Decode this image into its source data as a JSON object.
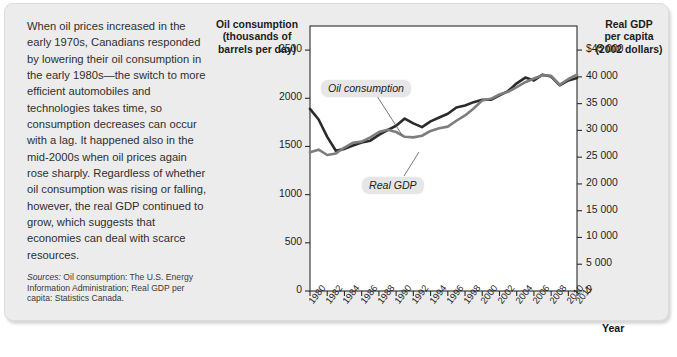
{
  "figure": {
    "background_color": "#ececec",
    "caption": "When oil prices increased in the early 1970s, Canadians responded by lowering their oil consumption in the early 1980s—the switch to more efficient automobiles and technologies takes time, so consumption decreases can occur with a lag. It happened also in the mid-2000s when oil prices again rose sharply. Regardless of whether oil consumption was rising or falling, however, the real GDP continued to grow, which suggests that economies can deal with scarce resources.",
    "sources_lead": "Sources:",
    "sources_text": " Oil consumption: The U.S. Energy Information Administration; Real GDP per capita: Statistics Canada."
  },
  "chart_data": {
    "type": "line",
    "title": "",
    "xlabel": "Year",
    "grid": false,
    "legend_position": "inline-annotations",
    "x": [
      1980,
      1981,
      1982,
      1983,
      1984,
      1985,
      1986,
      1987,
      1988,
      1989,
      1990,
      1991,
      1992,
      1993,
      1994,
      1995,
      1996,
      1997,
      1998,
      1999,
      2000,
      2001,
      2002,
      2003,
      2004,
      2005,
      2006,
      2007,
      2008,
      2009,
      2010,
      2011
    ],
    "xtick_labels": [
      "1980",
      "1982",
      "1984",
      "1986",
      "1988",
      "1990",
      "1992",
      "1994",
      "1996",
      "1998",
      "2000",
      "2002",
      "2004",
      "2006",
      "2008",
      "2010",
      "2011"
    ],
    "axes": {
      "left": {
        "label": "Oil consumption\n(thousands of\nbarrels per day)",
        "ticks": [
          0,
          500,
          1000,
          1500,
          2000,
          2500
        ],
        "tick_labels": [
          "0",
          "500",
          "1000",
          "1500",
          "2000",
          "2500"
        ],
        "ylim": [
          0,
          2750
        ]
      },
      "right": {
        "label": "Real GDP\nper capita\n(2002 dollars)",
        "ticks": [
          0,
          5000,
          10000,
          15000,
          20000,
          25000,
          30000,
          35000,
          40000,
          45000
        ],
        "tick_labels": [
          "0",
          "5 000",
          "10 000",
          "15 000",
          "20 000",
          "25 000",
          "30 000",
          "35 000",
          "40 000",
          "$45 000"
        ],
        "ylim": [
          0,
          49500
        ]
      }
    },
    "series": [
      {
        "name": "Oil consumption",
        "axis": "left",
        "color": "#2b2b2b",
        "units": "thousands of barrels per day",
        "values": [
          1890,
          1780,
          1600,
          1455,
          1475,
          1510,
          1540,
          1560,
          1620,
          1670,
          1715,
          1790,
          1740,
          1700,
          1760,
          1800,
          1840,
          1905,
          1925,
          1960,
          1985,
          1985,
          2030,
          2075,
          2155,
          2215,
          2185,
          2245,
          2225,
          2135,
          2185,
          2210
        ]
      },
      {
        "name": "Real GDP",
        "axis": "right",
        "color": "#7d7d7d",
        "units": "2002 dollars per capita",
        "values": [
          25900,
          26400,
          25400,
          25700,
          26800,
          27700,
          27900,
          28700,
          29700,
          30100,
          29700,
          28800,
          28700,
          29000,
          29900,
          30400,
          30700,
          31800,
          32800,
          34100,
          35600,
          35900,
          36700,
          37200,
          38100,
          39000,
          39700,
          40300,
          40200,
          38500,
          39600,
          40400
        ]
      }
    ],
    "annotations": [
      {
        "text": "Oil consumption",
        "series": "Oil consumption",
        "points_to_year": 1990
      },
      {
        "text": "Real GDP",
        "series": "Real GDP",
        "points_to_year": 1993
      }
    ]
  }
}
